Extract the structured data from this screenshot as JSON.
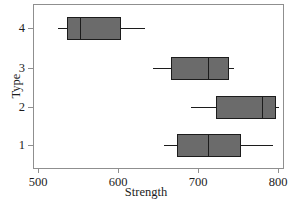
{
  "chart_data": {
    "type": "box",
    "orientation": "horizontal",
    "title": "",
    "xlabel": "Strength",
    "ylabel": "Type",
    "xlim": [
      490,
      810
    ],
    "xticks": [
      500,
      600,
      700,
      800
    ],
    "xtick_labels": [
      "500",
      "600",
      "700",
      "800"
    ],
    "ycategories": [
      "1",
      "2",
      "3",
      "4"
    ],
    "ytick_labels": [
      "4",
      "3",
      "2",
      "1"
    ],
    "grid": false,
    "legend": null,
    "box_fill": "#6b6b6b",
    "box_edge": "#1c1c1c",
    "frame_color": "#8f8f8f",
    "boxes": [
      {
        "category": "4",
        "whisker_low": 524,
        "q1": 536,
        "median": 552,
        "q3": 602,
        "whisker_high": 632
      },
      {
        "category": "3",
        "whisker_low": 642,
        "q1": 666,
        "median": 713,
        "q3": 738,
        "whisker_high": 744
      },
      {
        "category": "2",
        "whisker_low": 690,
        "q1": 723,
        "median": 780,
        "q3": 796,
        "whisker_high": 800
      },
      {
        "category": "1",
        "whisker_low": 656,
        "q1": 674,
        "median": 713,
        "q3": 753,
        "whisker_high": 793
      }
    ]
  },
  "axes": {
    "x_title": "Strength",
    "y_title": "Type",
    "x_tick_labels": [
      "500",
      "600",
      "700",
      "800"
    ],
    "y_tick_labels": [
      "4",
      "3",
      "2",
      "1"
    ]
  }
}
